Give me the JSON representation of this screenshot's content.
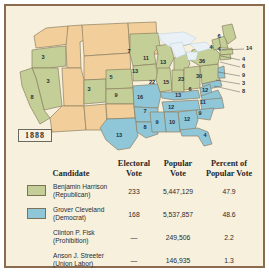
{
  "chart_data": {
    "type": "map",
    "title": "1888",
    "year": "1888",
    "colors": {
      "republican": "#c3cf96",
      "democrat": "#8fc6d8",
      "territory": "#f2cf9a",
      "lake": "#e9f1f6",
      "background": "#f7f0dd",
      "frame": "#8a6b4f"
    },
    "states_on_map": [
      {
        "label": "3",
        "party": "republican",
        "x": 37,
        "y": 52
      },
      {
        "label": "3",
        "party": "republican",
        "x": 42,
        "y": 76
      },
      {
        "label": "8",
        "party": "republican",
        "x": 26,
        "y": 92
      },
      {
        "label": "3",
        "party": "republican",
        "x": 83,
        "y": 84
      },
      {
        "label": "5",
        "party": "republican",
        "x": 105,
        "y": 72
      },
      {
        "label": "9",
        "party": "republican",
        "x": 110,
        "y": 90
      },
      {
        "label": "7",
        "party": "republican",
        "x": 123,
        "y": 46
      },
      {
        "label": "11",
        "party": "republican",
        "x": 140,
        "y": 53
      },
      {
        "label": "13",
        "party": "republican",
        "x": 129,
        "y": 66
      },
      {
        "label": "13",
        "party": "republican",
        "x": 157,
        "y": 57
      },
      {
        "label": "22",
        "party": "republican",
        "x": 146,
        "y": 77
      },
      {
        "label": "15",
        "party": "republican",
        "x": 160,
        "y": 77
      },
      {
        "label": "23",
        "party": "republican",
        "x": 175,
        "y": 74
      },
      {
        "label": "30",
        "party": "republican",
        "x": 193,
        "y": 71
      },
      {
        "label": "36",
        "party": "republican",
        "x": 196,
        "y": 56
      },
      {
        "label": "16",
        "party": "democrat",
        "x": 134,
        "y": 92
      },
      {
        "label": "13",
        "party": "democrat",
        "x": 172,
        "y": 90
      },
      {
        "label": "6",
        "party": "democrat",
        "x": 184,
        "y": 84
      },
      {
        "label": "12",
        "party": "democrat",
        "x": 199,
        "y": 85
      },
      {
        "label": "11",
        "party": "democrat",
        "x": 197,
        "y": 97
      },
      {
        "label": "12",
        "party": "democrat",
        "x": 165,
        "y": 102
      },
      {
        "label": "9",
        "party": "democrat",
        "x": 194,
        "y": 108
      },
      {
        "label": "7",
        "party": "democrat",
        "x": 139,
        "y": 106
      },
      {
        "label": "9",
        "party": "democrat",
        "x": 151,
        "y": 117
      },
      {
        "label": "10",
        "party": "democrat",
        "x": 166,
        "y": 117
      },
      {
        "label": "12",
        "party": "democrat",
        "x": 181,
        "y": 114
      },
      {
        "label": "8",
        "party": "democrat",
        "x": 139,
        "y": 122
      },
      {
        "label": "13",
        "party": "democrat",
        "x": 113,
        "y": 130
      },
      {
        "label": "4",
        "party": "democrat",
        "x": 199,
        "y": 130
      },
      {
        "label": "6",
        "party": "republican",
        "x": 213,
        "y": 31
      },
      {
        "label": "4",
        "party": "republican",
        "x": 205,
        "y": 42
      },
      {
        "label": "4",
        "party": "republican",
        "x": 213,
        "y": 44
      }
    ],
    "leader_labels": [
      {
        "label": "14",
        "x": 240,
        "y": 43
      },
      {
        "label": "4",
        "x": 236,
        "y": 54
      },
      {
        "label": "6",
        "x": 236,
        "y": 61
      },
      {
        "label": "9",
        "x": 236,
        "y": 70
      },
      {
        "label": "3",
        "x": 236,
        "y": 78
      },
      {
        "label": "8",
        "x": 236,
        "y": 86
      }
    ]
  },
  "table": {
    "headers": {
      "candidate": "Candidate",
      "electoral_vote_l1": "Electoral",
      "electoral_vote_l2": "Vote",
      "popular_vote_l1": "Popular",
      "popular_vote_l2": "Vote",
      "percent_l1": "Percent of",
      "percent_l2": "Popular Vote"
    },
    "rows": [
      {
        "name": "Benjamin Harrison",
        "party": "(Republican)",
        "swatch": "rep",
        "electoral_vote": "233",
        "popular_vote": "5,447,129",
        "percent": "47.9"
      },
      {
        "name": "Grover Cleveland",
        "party": "(Democrat)",
        "swatch": "dem",
        "electoral_vote": "168",
        "popular_vote": "5,537,857",
        "percent": "48.6"
      },
      {
        "name": "Clinton P. Fisk",
        "party": "(Prohibition)",
        "swatch": "none",
        "electoral_vote": "—",
        "popular_vote": "249,506",
        "percent": "2.2"
      },
      {
        "name": "Anson J. Streeter",
        "party": "(Union Labor)",
        "swatch": "none",
        "electoral_vote": "—",
        "popular_vote": "146,935",
        "percent": "1.3"
      }
    ]
  }
}
